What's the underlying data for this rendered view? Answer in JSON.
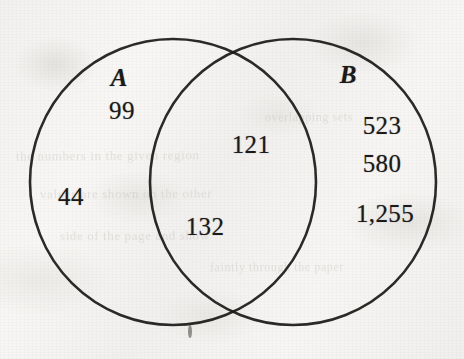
{
  "figure": {
    "background_color": "#f6f5f3",
    "stroke_color": "#1b1a18"
  },
  "sets": [
    {
      "id": "A",
      "label": "A",
      "label_x": 119,
      "label_y": 78,
      "circle": {
        "cx": 173,
        "cy": 182,
        "r": 143
      }
    },
    {
      "id": "B",
      "label": "B",
      "label_x": 348,
      "label_y": 75,
      "circle": {
        "cx": 293,
        "cy": 182,
        "r": 143
      }
    }
  ],
  "values": [
    {
      "name": "a-only-top",
      "text": "99",
      "region": "A only",
      "x": 122,
      "y": 111
    },
    {
      "name": "a-only-bottom",
      "text": "44",
      "region": "A only",
      "x": 71,
      "y": 197
    },
    {
      "name": "intersect-top",
      "text": "121",
      "region": "A and B",
      "x": 251,
      "y": 145
    },
    {
      "name": "intersect-bottom",
      "text": "132",
      "region": "A and B",
      "x": 205,
      "y": 227
    },
    {
      "name": "b-only-first",
      "text": "523",
      "region": "B only",
      "x": 382,
      "y": 126
    },
    {
      "name": "b-only-second",
      "text": "580",
      "region": "B only",
      "x": 382,
      "y": 164
    },
    {
      "name": "b-only-third",
      "text": "1,255",
      "region": "B only",
      "x": 385,
      "y": 214
    }
  ],
  "ghost_text": [
    {
      "text": "the  numbers  in  the  given  region",
      "x": 16,
      "y": 148,
      "size": 13,
      "rotate": -0.4
    },
    {
      "text": "values  are  shown  on  the  other",
      "x": 40,
      "y": 186,
      "size": 13,
      "rotate": -0.3
    },
    {
      "text": "side  of  the  page  and  show",
      "x": 60,
      "y": 228,
      "size": 13,
      "rotate": -0.2
    },
    {
      "text": "faintly  through  the  paper",
      "x": 210,
      "y": 260,
      "size": 12,
      "rotate": -0.3
    },
    {
      "text": "overlapping  sets",
      "x": 265,
      "y": 110,
      "size": 12,
      "rotate": -0.4
    }
  ]
}
